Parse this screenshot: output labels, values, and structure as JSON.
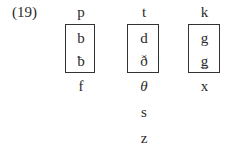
{
  "example_number": "(19)",
  "columns": [
    {
      "top": "p",
      "boxed": [
        "b",
        "ƀ"
      ],
      "below": [
        "f"
      ]
    },
    {
      "top": "t",
      "boxed": [
        "d",
        "ð"
      ],
      "below": [
        "θ",
        "s",
        "z"
      ]
    },
    {
      "top": "k",
      "boxed": [
        "g",
        "ǥ"
      ],
      "below": [
        "x"
      ]
    }
  ]
}
